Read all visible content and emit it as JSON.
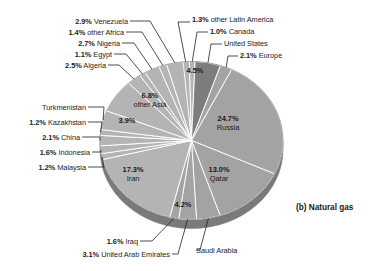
{
  "caption": "(b) Natural gas",
  "chart_data": {
    "type": "pie",
    "title": "(b) Natural gas",
    "xlabel": "",
    "ylabel": "",
    "unit": "percent",
    "legend_position": "callout-labels",
    "grid": false,
    "categories": [
      "Russia",
      "Iran",
      "Qatar",
      "other Asia",
      "United States",
      "Saudi Arabia",
      "Turkmenistan",
      "United Arab Emirates",
      "Venezuela",
      "Nigeria",
      "Algeria",
      "Europe",
      "China",
      "Indonesia",
      "Iraq",
      "other Africa",
      "other Latin America",
      "Kazakhstan",
      "Malaysia",
      "Egypt",
      "Canada"
    ],
    "values": [
      24.7,
      17.3,
      13.0,
      6.8,
      4.5,
      4.2,
      3.9,
      3.1,
      2.9,
      2.7,
      2.5,
      2.1,
      2.1,
      1.6,
      1.6,
      1.4,
      1.3,
      1.2,
      1.2,
      1.1,
      1.0
    ]
  },
  "slices": {
    "russia": {
      "pct": "24.7%",
      "name": "Russia"
    },
    "iran": {
      "pct": "17.3%",
      "name": "Iran"
    },
    "qatar": {
      "pct": "13.0%",
      "name": "Qatar"
    },
    "other_asia": {
      "pct": "6.8%",
      "name": "other Asia"
    },
    "united_states": {
      "pct": "4.5%",
      "name": "United States"
    },
    "saudi_arabia": {
      "pct": "4.2%",
      "name": "Saudi Arabia"
    },
    "turkmenistan": {
      "pct": "3.9%",
      "name": "Turkmenistan"
    },
    "uae": {
      "pct": "3.1%",
      "name": "United Arab Emirates"
    },
    "venezuela": {
      "pct": "2.9%",
      "name": "Venezuela"
    },
    "nigeria": {
      "pct": "2.7%",
      "name": "Nigeria"
    },
    "algeria": {
      "pct": "2.5%",
      "name": "Algeria"
    },
    "europe": {
      "pct": "2.1%",
      "name": "Europe"
    },
    "china": {
      "pct": "2.1%",
      "name": "China"
    },
    "indonesia": {
      "pct": "1.6%",
      "name": "Indonesia"
    },
    "iraq": {
      "pct": "1.6%",
      "name": "Iraq"
    },
    "other_africa": {
      "pct": "1.4%",
      "name": "other Africa"
    },
    "other_latin": {
      "pct": "1.3%",
      "name": "other Latin America"
    },
    "kazakhstan": {
      "pct": "1.2%",
      "name": "Kazakhstan"
    },
    "malaysia": {
      "pct": "1.2%",
      "name": "Malaysia"
    },
    "egypt": {
      "pct": "1.1%",
      "name": "Egypt"
    },
    "canada": {
      "pct": "1.0%",
      "name": "Canada"
    }
  },
  "colors": {
    "slice_light": "#b4b4b4",
    "slice_mid": "#a3a3a3",
    "slice_dark": "#7d7d7d",
    "rim": "#7a7a7a",
    "edge": "#ffffff",
    "text": "#1d1d1d",
    "background": "#ffffff"
  }
}
